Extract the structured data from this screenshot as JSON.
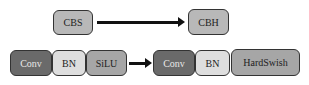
{
  "top_row": {
    "from": {
      "label": "CBS",
      "color": "#b8b8b8"
    },
    "to": {
      "label": "CBH",
      "color": "#b8b8b8"
    }
  },
  "bottom_row": {
    "before": [
      {
        "label": "Conv",
        "color": "#6a6a6a"
      },
      {
        "label": "BN",
        "color": "#dedede"
      },
      {
        "label": "SiLU",
        "color": "#a6a6a6"
      }
    ],
    "after": [
      {
        "label": "Conv",
        "color": "#6a6a6a"
      },
      {
        "label": "BN",
        "color": "#dedede"
      },
      {
        "label": "HardSwish",
        "color": "#a6a6a6"
      }
    ]
  }
}
